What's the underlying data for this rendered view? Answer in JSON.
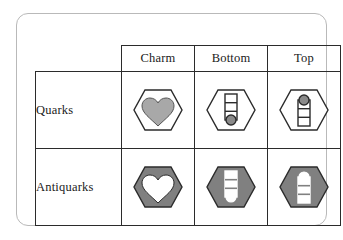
{
  "figure": {
    "kind": "quark-flavor-symbol-table",
    "frame_border_color": "#b9b9b9",
    "grid_line_color": "#2b2b2b",
    "background_color": "#ffffff"
  },
  "table": {
    "corner_label": "",
    "column_headers": [
      {
        "id": "charm",
        "label": "Charm"
      },
      {
        "id": "bottom",
        "label": "Bottom"
      },
      {
        "id": "top",
        "label": "Top"
      }
    ],
    "rows": [
      {
        "id": "quarks",
        "label": "Quarks",
        "cells": [
          {
            "column": "charm",
            "symbol_name": "heart-in-hexagon",
            "hexagon_fill": "#ffffff",
            "hexagon_stroke": "#2b2b2b",
            "glyph": "heart",
            "glyph_fill": "#a8a8a8",
            "glyph_stroke": "#555555",
            "marker_position": "none",
            "alt": "White hexagon containing a gray heart"
          },
          {
            "column": "bottom",
            "symbol_name": "ladder-in-hexagon-bottom-marker",
            "hexagon_fill": "#ffffff",
            "hexagon_stroke": "#2b2b2b",
            "glyph": "ladder",
            "glyph_fill": "#ffffff",
            "glyph_stroke": "#2b2b2b",
            "marker_position": "bottom",
            "marker_fill": "#8a8a8a",
            "alt": "White hexagon containing a ladder with a dark circle at the bottom"
          },
          {
            "column": "top",
            "symbol_name": "ladder-in-hexagon-top-marker",
            "hexagon_fill": "#ffffff",
            "hexagon_stroke": "#2b2b2b",
            "glyph": "ladder",
            "glyph_fill": "#ffffff",
            "glyph_stroke": "#2b2b2b",
            "marker_position": "top",
            "marker_fill": "#8a8a8a",
            "alt": "White hexagon containing a ladder with a dark circle at the top"
          }
        ]
      },
      {
        "id": "antiquarks",
        "label": "Antiquarks",
        "cells": [
          {
            "column": "charm",
            "symbol_name": "heart-in-filled-hexagon",
            "hexagon_fill": "#808080",
            "hexagon_stroke": "#2b2b2b",
            "glyph": "heart",
            "glyph_fill": "#ffffff",
            "glyph_stroke": "#2b2b2b",
            "marker_position": "none",
            "alt": "Gray hexagon containing a white heart"
          },
          {
            "column": "bottom",
            "symbol_name": "ladder-in-filled-hexagon-bottom-marker",
            "hexagon_fill": "#808080",
            "hexagon_stroke": "#2b2b2b",
            "glyph": "ladder",
            "glyph_fill": "#ffffff",
            "glyph_stroke": "#ffffff",
            "marker_position": "bottom",
            "marker_fill": "#ffffff",
            "alt": "Gray hexagon containing a white ladder with a white circle at the bottom"
          },
          {
            "column": "top",
            "symbol_name": "ladder-in-filled-hexagon-top-marker",
            "hexagon_fill": "#808080",
            "hexagon_stroke": "#2b2b2b",
            "glyph": "ladder",
            "glyph_fill": "#ffffff",
            "glyph_stroke": "#ffffff",
            "marker_position": "top",
            "marker_fill": "#ffffff",
            "alt": "Gray hexagon containing a white ladder with a white circle at the top"
          }
        ]
      }
    ]
  }
}
